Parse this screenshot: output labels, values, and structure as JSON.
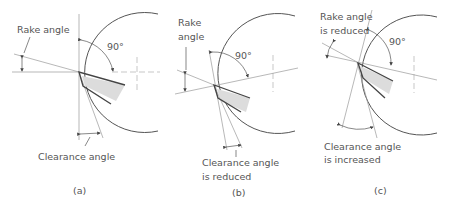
{
  "figure": {
    "panels": [
      {
        "id": "a",
        "caption": "(a)",
        "rake_label": [
          "Rake angle"
        ],
        "angle_label": "90°",
        "clearance_label": [
          "Clearance angle"
        ]
      },
      {
        "id": "b",
        "caption": "(b)",
        "rake_label": [
          "Rake",
          "angle"
        ],
        "angle_label": "90°",
        "clearance_label": [
          "Clearance angle",
          "is reduced"
        ]
      },
      {
        "id": "c",
        "caption": "(c)",
        "rake_label": [
          "Rake angle",
          "is reduced"
        ],
        "angle_label": "90°",
        "clearance_label": [
          "Clearance angle",
          "is increased"
        ]
      }
    ]
  }
}
